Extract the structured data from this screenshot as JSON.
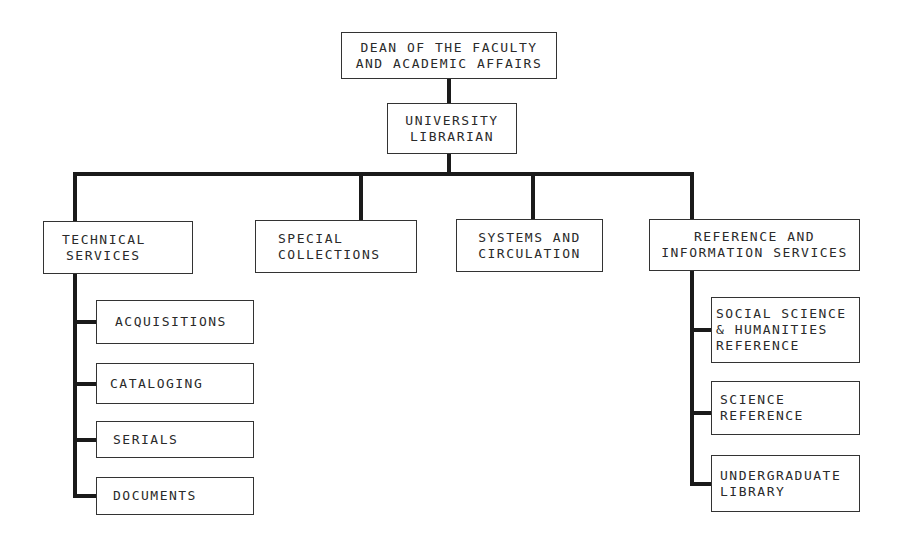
{
  "chart": {
    "root": {
      "lines": [
        "DEAN OF THE FACULTY",
        "AND ACADEMIC AFFAIRS"
      ]
    },
    "librarian": {
      "lines": [
        "UNIVERSITY",
        "LIBRARIAN"
      ]
    },
    "departments": [
      {
        "lines": [
          "TECHNICAL",
          "SERVICES"
        ],
        "children": [
          {
            "lines": [
              "ACQUISITIONS"
            ]
          },
          {
            "lines": [
              "CATALOGING"
            ]
          },
          {
            "lines": [
              "SERIALS"
            ]
          },
          {
            "lines": [
              "DOCUMENTS"
            ]
          }
        ]
      },
      {
        "lines": [
          "SPECIAL",
          "COLLECTIONS"
        ],
        "children": []
      },
      {
        "lines": [
          "SYSTEMS AND",
          "CIRCULATION"
        ],
        "children": []
      },
      {
        "lines": [
          "REFERENCE AND",
          "INFORMATION SERVICES"
        ],
        "children": [
          {
            "lines": [
              "SOCIAL SCIENCE",
              "& HUMANITIES",
              "REFERENCE"
            ]
          },
          {
            "lines": [
              "SCIENCE",
              "REFERENCE"
            ]
          },
          {
            "lines": [
              "UNDERGRADUATE",
              "LIBRARY"
            ]
          }
        ]
      }
    ]
  }
}
